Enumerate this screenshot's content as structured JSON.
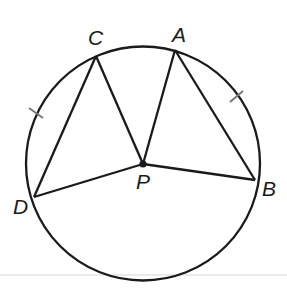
{
  "diagram": {
    "center_label": "P",
    "points": [
      {
        "id": "C",
        "label": "C"
      },
      {
        "id": "A",
        "label": "A"
      },
      {
        "id": "B",
        "label": "B"
      },
      {
        "id": "D",
        "label": "D"
      },
      {
        "id": "P",
        "label": "P"
      }
    ],
    "segments": [
      {
        "from": "D",
        "to": "C",
        "type": "chord"
      },
      {
        "from": "C",
        "to": "P",
        "type": "radius"
      },
      {
        "from": "P",
        "to": "A",
        "type": "radius"
      },
      {
        "from": "A",
        "to": "B",
        "type": "chord"
      },
      {
        "from": "P",
        "to": "B",
        "type": "radius"
      },
      {
        "from": "P",
        "to": "D",
        "type": "radius"
      }
    ],
    "congruence_marks": [
      {
        "arc": "DC",
        "ticks": 1
      },
      {
        "arc": "AB",
        "ticks": 1
      }
    ],
    "colors": {
      "stroke": "#1a1a1a",
      "tick": "#777777",
      "baseline": "#e4e4e4"
    }
  }
}
